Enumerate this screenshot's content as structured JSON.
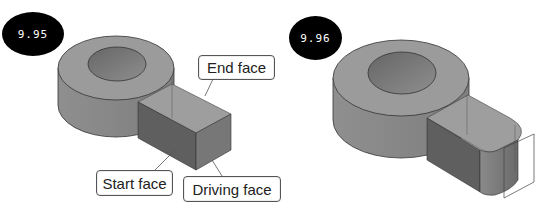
{
  "figures": [
    {
      "id": "9.95",
      "badge": "9.95",
      "callouts": {
        "end_face": "End face",
        "start_face": "Start face",
        "driving_face": "Driving face"
      }
    },
    {
      "id": "9.96",
      "badge": "9.96"
    }
  ],
  "colors": {
    "badge_bg": "#000000",
    "badge_text": "#ffffff",
    "part_top": "#9a9a9a",
    "part_side": "#8a8a8a",
    "part_dark": "#5e5e5e",
    "hole": "#7a7a7a",
    "outline": "#333333"
  }
}
